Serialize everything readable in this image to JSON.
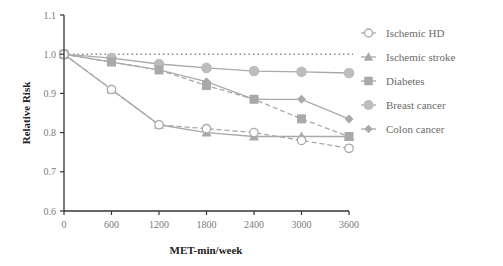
{
  "chart_data": {
    "type": "line",
    "title": "",
    "xlabel": "MET-min/week",
    "ylabel": "Relative Risk",
    "x": [
      0,
      600,
      1200,
      1800,
      2400,
      3000,
      3600
    ],
    "xticks": [
      "0",
      "600",
      "1200",
      "1800",
      "2400",
      "3000",
      "3600"
    ],
    "yticks": [
      "0.6",
      "0.7",
      "0.8",
      "0.9",
      "1.0",
      "1.1"
    ],
    "ylim": [
      0.6,
      1.1
    ],
    "xlim": [
      0,
      3600
    ],
    "grid": false,
    "reference_line": {
      "y": 1.0,
      "style": "dotted"
    },
    "legend_position": "right",
    "series": [
      {
        "name": "Ischemic HD",
        "marker": "open-circle",
        "line": "dashed",
        "values": [
          1.0,
          0.91,
          0.82,
          0.81,
          0.8,
          0.78,
          0.76
        ]
      },
      {
        "name": "Ischemic stroke",
        "marker": "triangle",
        "line": "solid",
        "values": [
          1.0,
          0.91,
          0.82,
          0.8,
          0.79,
          0.79,
          0.79
        ]
      },
      {
        "name": "Diabetes",
        "marker": "square",
        "line": "dashed",
        "values": [
          1.0,
          0.98,
          0.96,
          0.92,
          0.885,
          0.835,
          0.79
        ]
      },
      {
        "name": "Breast cancer",
        "marker": "circle",
        "line": "solid",
        "values": [
          1.0,
          0.99,
          0.975,
          0.965,
          0.957,
          0.955,
          0.952
        ]
      },
      {
        "name": "Colon cancer",
        "marker": "diamond",
        "line": "solid",
        "values": [
          1.0,
          0.98,
          0.96,
          0.93,
          0.885,
          0.885,
          0.835
        ]
      }
    ]
  },
  "colors": {
    "series": "#a9a9a9",
    "axis": "#333333",
    "reference": "#8a8a8a"
  }
}
